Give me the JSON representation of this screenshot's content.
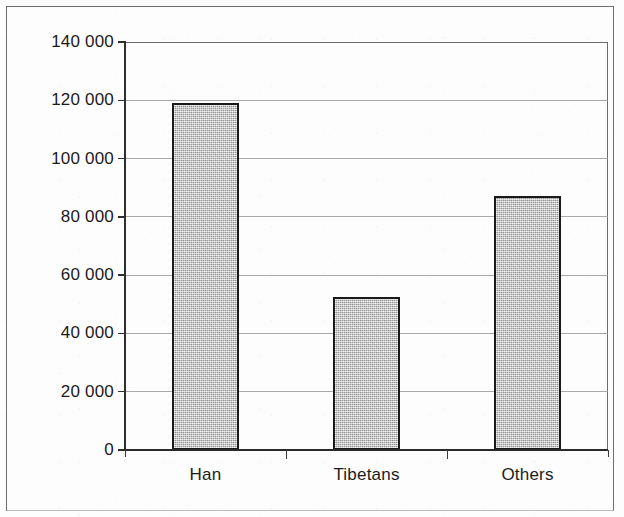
{
  "chart_data": {
    "type": "bar",
    "title": "",
    "subtitle": "",
    "xlabel": "",
    "ylabel": "",
    "categories": [
      "Han",
      "Tibetans",
      "Others"
    ],
    "values": [
      119000,
      52500,
      87000
    ],
    "series": [
      {
        "name": "Population",
        "values": [
          119000,
          52500,
          87000
        ]
      }
    ],
    "ylim": [
      0,
      140000
    ],
    "xlim": [
      0,
      3
    ],
    "y_ticks": [
      0,
      20000,
      40000,
      60000,
      80000,
      100000,
      120000,
      140000
    ],
    "y_tick_labels": [
      "0",
      "20 000",
      "40 000",
      "60 000",
      "80 000",
      "100 000",
      "120 000",
      "140 000"
    ],
    "grid": true,
    "grid_axis": "y",
    "legend": false,
    "legend_position": "none",
    "annotations": [],
    "bar_fill_color": "#c3c3c3",
    "bar_edge_color": "#1a1a1a",
    "gridline_color": "#9a9a9a",
    "axis_color": "#2a2a2a",
    "background_color": "#ffffff",
    "frame_border_color": "#6e6e6e"
  }
}
